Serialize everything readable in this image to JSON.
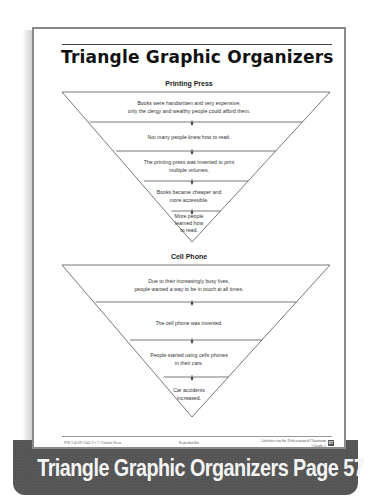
{
  "page": {
    "title": "Triangle Graphic Organizers",
    "organizers": [
      {
        "heading": "Printing Press",
        "levels": [
          {
            "text_lines": [
              "Books were handwritten and very expensive;",
              "only the clergy and wealthy people could afford them."
            ]
          },
          {
            "text_lines": [
              "Not many people knew how to read."
            ]
          },
          {
            "text_lines": [
              "The printing press was invented to print",
              "multiple volumes."
            ]
          },
          {
            "text_lines": [
              "Books became cheaper and",
              "more accessible."
            ]
          },
          {
            "text_lines": [
              "More people",
              "learned how",
              "to read."
            ]
          }
        ]
      },
      {
        "heading": "Cell Phone",
        "levels": [
          {
            "text_lines": [
              "Due to their increasingly busy lives,",
              "people wanted a way to be in touch at all times."
            ]
          },
          {
            "text_lines": [
              "The cell phone was invented."
            ]
          },
          {
            "text_lines": [
              "People started using cells phones",
              "in their cars."
            ]
          },
          {
            "text_lines": [
              "Car accidents",
              "increased."
            ]
          }
        ]
      }
    ],
    "footer": {
      "left": "978-1-4129-5341-2 • © Corwin Press",
      "center": "Reproducible",
      "right_line1": "Activities for the Differentiated Classroom",
      "right_line2": "• Grade 1",
      "page_number": "57"
    }
  },
  "banner": {
    "caption": "Triangle Graphic Organizers Page 57"
  },
  "colors": {
    "banner_bg": "#555555",
    "banner_text": "#f4f4f4",
    "page_border": "#8a8a8a",
    "line": "#555555"
  }
}
